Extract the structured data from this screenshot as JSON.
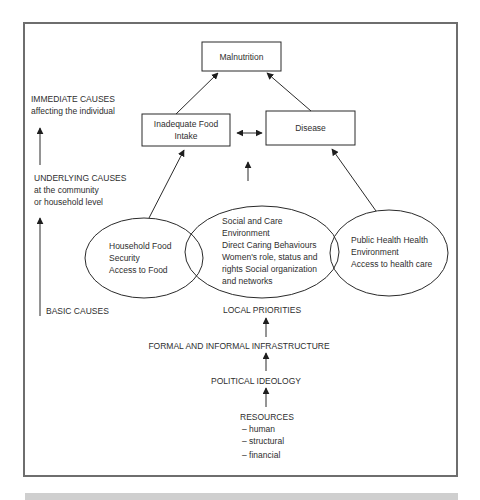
{
  "diagram": {
    "title_box": "Malnutrition",
    "immediate_boxes": [
      {
        "line1": "Inadequate Food",
        "line2": "Intake"
      },
      {
        "line1": "Disease"
      }
    ],
    "side_labels": {
      "immediate": {
        "heading": "IMMEDIATE CAUSES",
        "sub": "affecting the individual"
      },
      "underlying": {
        "heading": "UNDERLYING CAUSES",
        "sub1": "at the community",
        "sub2": "or household level"
      },
      "basic": {
        "heading": "BASIC CAUSES"
      }
    },
    "ellipses": [
      {
        "lines": [
          "Household Food",
          "Security",
          "Access to Food"
        ]
      },
      {
        "lines": [
          "Social and Care",
          "Environment",
          "Direct Caring Behaviours",
          "Women's role, status and",
          "rights Social organization",
          "and networks"
        ]
      },
      {
        "lines": [
          "Public Health Health",
          "Environment",
          "Access to health care"
        ]
      }
    ],
    "basic_chain": {
      "local_priorities": "LOCAL PRIORITIES",
      "infrastructure": "FORMAL AND INFORMAL INFRASTRUCTURE",
      "ideology": "POLITICAL IDEOLOGY",
      "resources": "RESOURCES",
      "resource_items": [
        "– human",
        "– structural",
        "– financial"
      ]
    }
  },
  "colors": {
    "line": "#2a2a2a",
    "frame": "#6e6e6e",
    "footer_bar": "#cfcfcf"
  }
}
